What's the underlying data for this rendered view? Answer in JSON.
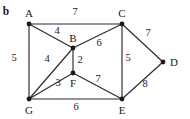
{
  "figure": {
    "panel_label": "b",
    "background_color": "#ffffff",
    "ink_color": "#1a1a1a"
  },
  "chart_data": {
    "type": "diagram",
    "diagram_type": "weighted-undirected-graph",
    "title": "b",
    "xlabel": "",
    "ylabel": "",
    "grid": false,
    "legend": null,
    "nodes": [
      {
        "id": "A",
        "label": "A",
        "x": 29,
        "y": 24,
        "label_x": 29,
        "label_y": 13
      },
      {
        "id": "C",
        "label": "C",
        "x": 122,
        "y": 24,
        "label_x": 122,
        "label_y": 13
      },
      {
        "id": "B",
        "label": "B",
        "x": 73,
        "y": 48,
        "label_x": 73,
        "label_y": 38
      },
      {
        "id": "D",
        "label": "D",
        "x": 163,
        "y": 62,
        "label_x": 174,
        "label_y": 62
      },
      {
        "id": "F",
        "label": "F",
        "x": 73,
        "y": 73,
        "label_x": 73,
        "label_y": 83
      },
      {
        "id": "G",
        "label": "G",
        "x": 29,
        "y": 99,
        "label_x": 29,
        "label_y": 110
      },
      {
        "id": "E",
        "label": "E",
        "x": 122,
        "y": 99,
        "label_x": 122,
        "label_y": 110
      }
    ],
    "edges": [
      {
        "from": "A",
        "to": "C",
        "weight": 7,
        "label_x": 75,
        "label_y": 12
      },
      {
        "from": "A",
        "to": "B",
        "weight": 4,
        "label_x": 57,
        "label_y": 31
      },
      {
        "from": "A",
        "to": "G",
        "weight": 5,
        "label_x": 14,
        "label_y": 58
      },
      {
        "from": "B",
        "to": "C",
        "weight": 6,
        "label_x": 99,
        "label_y": 43
      },
      {
        "from": "B",
        "to": "G",
        "weight": 4,
        "label_x": 47,
        "label_y": 59
      },
      {
        "from": "B",
        "to": "F",
        "weight": 2,
        "label_x": 80,
        "label_y": 60
      },
      {
        "from": "G",
        "to": "F",
        "weight": 3,
        "label_x": 58,
        "label_y": 83
      },
      {
        "from": "G",
        "to": "E",
        "weight": 6,
        "label_x": 76,
        "label_y": 107
      },
      {
        "from": "F",
        "to": "E",
        "weight": 7,
        "label_x": 98,
        "label_y": 79
      },
      {
        "from": "C",
        "to": "E",
        "weight": 5,
        "label_x": 128,
        "label_y": 58
      },
      {
        "from": "C",
        "to": "D",
        "weight": 7,
        "label_x": 148,
        "label_y": 33
      },
      {
        "from": "E",
        "to": "D",
        "weight": 8,
        "label_x": 145,
        "label_y": 84
      }
    ]
  }
}
